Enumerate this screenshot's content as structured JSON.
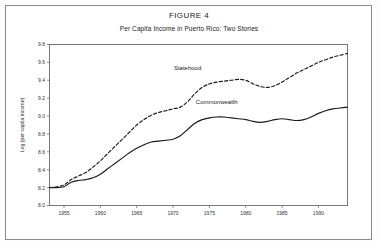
{
  "figure": {
    "title": "FIGURE 4",
    "subtitle": "Per Capita Income in Puerto Rico: Two Stories"
  },
  "chart_data": {
    "type": "line",
    "title": "FIGURE 4",
    "subtitle": "Per Capita Income in Puerto Rico: Two Stories",
    "xlabel": "",
    "ylabel": "Log (per capita income)",
    "xlim": [
      1953,
      1994
    ],
    "ylim": [
      8.0,
      9.8
    ],
    "grid": false,
    "legend_position": "inline-annotation",
    "xticks": [
      1955,
      1960,
      1965,
      1970,
      1975,
      1980,
      1985,
      1990
    ],
    "xtick_labels": [
      "1955",
      "1960",
      "1965",
      "1970",
      "1975",
      "1980",
      "1985",
      "1990"
    ],
    "yticks": [
      8.0,
      8.2,
      8.4,
      8.6,
      8.8,
      9.0,
      9.2,
      9.4,
      9.6,
      9.8
    ],
    "ytick_labels": [
      "8.0",
      "8.2",
      "8.4",
      "8.6",
      "8.8",
      "9.0",
      "9.2",
      "9.4",
      "9.6",
      "9.8"
    ],
    "x": [
      1953,
      1954,
      1955,
      1956,
      1957,
      1958,
      1959,
      1960,
      1961,
      1962,
      1963,
      1964,
      1965,
      1966,
      1967,
      1968,
      1969,
      1970,
      1971,
      1972,
      1973,
      1974,
      1975,
      1976,
      1977,
      1978,
      1979,
      1980,
      1981,
      1982,
      1983,
      1984,
      1985,
      1986,
      1987,
      1988,
      1989,
      1990,
      1991,
      1992,
      1993,
      1994
    ],
    "series": [
      {
        "name": "Statehood",
        "style": "dashed",
        "color": "#1a1a1a",
        "values": [
          8.2,
          8.21,
          8.23,
          8.29,
          8.33,
          8.37,
          8.43,
          8.5,
          8.58,
          8.66,
          8.74,
          8.82,
          8.9,
          8.96,
          9.01,
          9.04,
          9.06,
          9.08,
          9.1,
          9.16,
          9.25,
          9.32,
          9.36,
          9.38,
          9.39,
          9.4,
          9.41,
          9.4,
          9.36,
          9.33,
          9.32,
          9.34,
          9.38,
          9.43,
          9.48,
          9.52,
          9.56,
          9.6,
          9.63,
          9.66,
          9.68,
          9.7
        ]
      },
      {
        "name": "Commonwealth",
        "style": "solid",
        "color": "#1a1a1a",
        "values": [
          8.2,
          8.2,
          8.21,
          8.26,
          8.28,
          8.29,
          8.31,
          8.35,
          8.41,
          8.47,
          8.53,
          8.59,
          8.64,
          8.68,
          8.71,
          8.72,
          8.73,
          8.74,
          8.78,
          8.85,
          8.92,
          8.96,
          8.98,
          8.99,
          8.99,
          8.98,
          8.97,
          8.96,
          8.94,
          8.93,
          8.94,
          8.96,
          8.97,
          8.96,
          8.95,
          8.96,
          8.99,
          9.03,
          9.06,
          9.08,
          9.09,
          9.1
        ]
      }
    ],
    "annotations": [
      {
        "text": "Statehood",
        "x": 1972,
        "y": 9.52
      },
      {
        "text": "Commonwealth",
        "x": 1976,
        "y": 9.14
      }
    ]
  }
}
